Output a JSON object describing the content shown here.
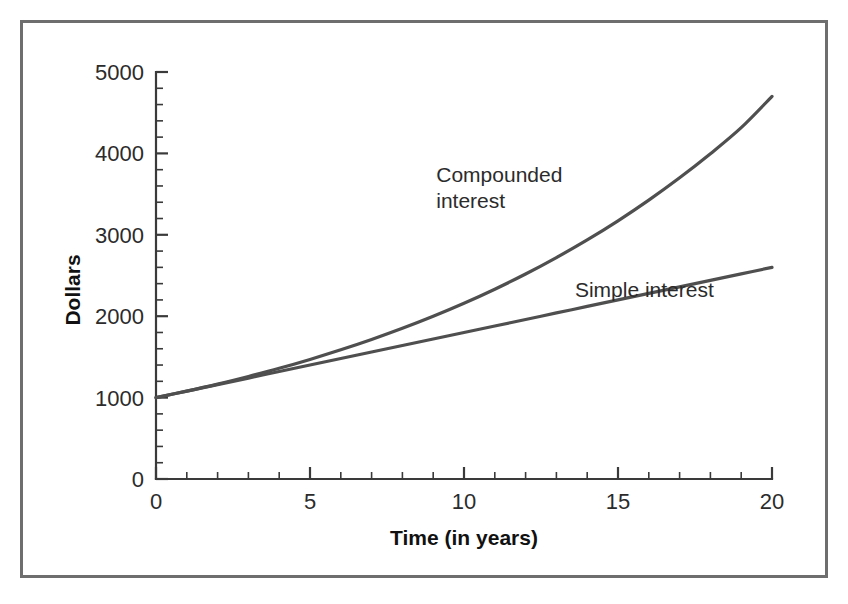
{
  "figure": {
    "frame_color": "#6e6e6e",
    "background": "#ffffff",
    "curve_color": "#4f4f4f",
    "axis_color": "#3a3a3a"
  },
  "chart_data": {
    "type": "line",
    "title": "",
    "subtitle": "",
    "xlabel": "Time (in years)",
    "ylabel": "Dollars",
    "xlim": [
      0,
      20
    ],
    "ylim": [
      0,
      5000
    ],
    "grid": false,
    "legend_position": "inline-annotations",
    "x_ticks": [
      0,
      5,
      10,
      15,
      20
    ],
    "x_tick_labels": [
      "0",
      "5",
      "10",
      "15",
      "20"
    ],
    "x_minor_tick_step": 1,
    "y_ticks": [
      0,
      1000,
      2000,
      3000,
      4000,
      5000
    ],
    "y_tick_labels": [
      "0",
      "1000",
      "2000",
      "3000",
      "4000",
      "5000"
    ],
    "y_minor_tick_step": 200,
    "x": [
      0,
      1,
      2,
      3,
      4,
      5,
      6,
      7,
      8,
      9,
      10,
      11,
      12,
      13,
      14,
      15,
      16,
      17,
      18,
      19,
      20
    ],
    "series": [
      {
        "name": "Compounded interest",
        "label_lines": [
          "Compounded",
          "interest"
        ],
        "color": "#4f4f4f",
        "values": [
          1000,
          1080,
          1166,
          1260,
          1360,
          1469,
          1587,
          1714,
          1851,
          1999,
          2159,
          2332,
          2518,
          2720,
          2937,
          3172,
          3426,
          3700,
          3996,
          4316,
          4700
        ]
      },
      {
        "name": "Simple interest",
        "label_lines": [
          "Simple interest"
        ],
        "color": "#4f4f4f",
        "values": [
          1000,
          1080,
          1160,
          1240,
          1320,
          1400,
          1480,
          1560,
          1640,
          1720,
          1800,
          1880,
          1960,
          2040,
          2120,
          2200,
          2280,
          2360,
          2440,
          2520,
          2600
        ]
      }
    ],
    "annotations": [
      {
        "text": "Compounded interest",
        "x": 9.1,
        "y": 3650
      },
      {
        "text": "Simple interest",
        "x": 13.6,
        "y": 2230
      }
    ]
  }
}
